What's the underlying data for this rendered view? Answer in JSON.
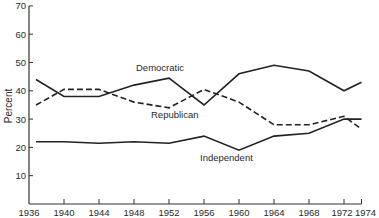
{
  "chart_data": {
    "type": "line",
    "title": "",
    "xlabel": "",
    "ylabel": "Percent",
    "ylim": [
      0,
      70
    ],
    "xlim": [
      1936,
      1974
    ],
    "grid": false,
    "legend": "inline labels",
    "x_ticks": [
      1936,
      1940,
      1944,
      1948,
      1952,
      1956,
      1960,
      1964,
      1968,
      1972,
      1974
    ],
    "y_ticks": [
      10,
      20,
      30,
      40,
      50,
      60,
      70
    ],
    "x": [
      1936,
      1940,
      1944,
      1948,
      1952,
      1956,
      1960,
      1964,
      1968,
      1972,
      1974
    ],
    "series": [
      {
        "name": "Democratic",
        "style": "solid",
        "label": "Democratic",
        "label_pos": [
          136,
          71
        ],
        "values": [
          44,
          38,
          38,
          42,
          44.5,
          35,
          46,
          49,
          47,
          40,
          43
        ]
      },
      {
        "name": "Republican",
        "style": "dashed",
        "label": "Republican",
        "label_pos": [
          151,
          118
        ],
        "values": [
          35,
          40.5,
          40.5,
          36,
          34,
          40.5,
          36,
          28,
          28,
          31,
          26.5
        ]
      },
      {
        "name": "Independent",
        "style": "solid",
        "label": "Independent",
        "label_pos": [
          200,
          161
        ],
        "values": [
          22,
          22,
          21.5,
          22,
          21.5,
          24,
          19,
          24,
          25,
          30,
          30
        ]
      }
    ]
  },
  "axis": {
    "y_title": "Percent",
    "x_tick_labels": [
      "1936",
      "1940",
      "1944",
      "1948",
      "1952",
      "1956",
      "1960",
      "1964",
      "1968",
      "1972",
      "1974"
    ],
    "y_tick_labels": [
      "10",
      "20",
      "30",
      "40",
      "50",
      "60",
      "70"
    ]
  },
  "colors": {
    "line": "#222222",
    "axis": "#333333",
    "text": "#2a2a2a"
  }
}
